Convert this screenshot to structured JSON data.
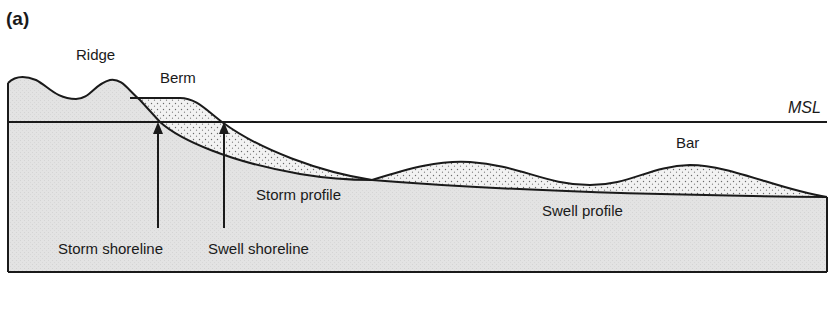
{
  "figure": {
    "panel_label": "(a)",
    "labels": {
      "ridge": "Ridge",
      "berm": "Berm",
      "msl": "MSL",
      "bar": "Bar",
      "storm_profile": "Storm profile",
      "swell_profile": "Swell profile",
      "storm_shoreline": "Storm shoreline",
      "swell_shoreline": "Swell shoreline"
    },
    "colors": {
      "outline": "#1a1a1a",
      "sediment_fill": "#e4e4e4",
      "stipple_fill": "#f2f2f2",
      "stipple_dot": "#6a6a6a"
    }
  }
}
